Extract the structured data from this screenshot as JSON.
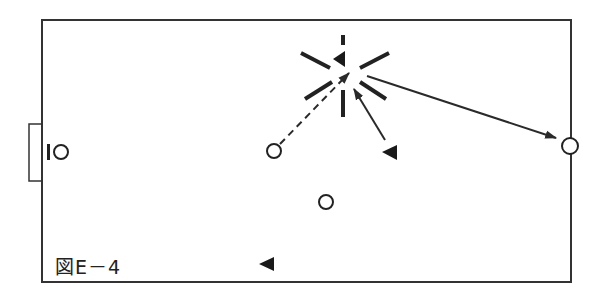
{
  "figure": {
    "caption": "図E－4",
    "colors": {
      "line": "#2a2a2a",
      "background": "#ffffff"
    }
  },
  "field": {
    "x": 42,
    "y": 20,
    "width": 529,
    "height": 262
  },
  "goal": {
    "x": 29,
    "y": 124,
    "width": 13,
    "height": 57
  },
  "goalkeeper": {
    "bar": {
      "x": 47,
      "y": 144,
      "width": 3,
      "height": 16
    },
    "circle": {
      "cx": 61,
      "cy": 152,
      "r": 7
    }
  },
  "players_circle": [
    {
      "id": "circle-mid-left",
      "cx": 274,
      "cy": 151,
      "r": 7
    },
    {
      "id": "circle-mid-low",
      "cx": 326,
      "cy": 202,
      "r": 7
    },
    {
      "id": "circle-right-edge",
      "cx": 570,
      "cy": 146,
      "r": 8
    }
  ],
  "players_triangle": [
    {
      "id": "triangle-burst-center",
      "points": "333,59 345,51 345,67"
    },
    {
      "id": "triangle-right",
      "points": "382,152 397,145 397,160"
    },
    {
      "id": "triangle-bottom",
      "points": "259,264 274,257 274,271"
    }
  ],
  "burst_lines": [
    {
      "x1": 343,
      "y1": 35,
      "x2": 343,
      "y2": 45
    },
    {
      "x1": 301,
      "y1": 53,
      "x2": 330,
      "y2": 68
    },
    {
      "x1": 360,
      "y1": 68,
      "x2": 389,
      "y2": 53
    },
    {
      "x1": 305,
      "y1": 99,
      "x2": 332,
      "y2": 82
    },
    {
      "x1": 360,
      "y1": 82,
      "x2": 386,
      "y2": 99
    },
    {
      "x1": 343,
      "y1": 90,
      "x2": 343,
      "y2": 117
    }
  ],
  "arrows": [
    {
      "id": "dashed-pass",
      "style": "dashed",
      "x1": 280,
      "y1": 144,
      "x2": 349,
      "y2": 73
    },
    {
      "id": "solid-run",
      "style": "solid",
      "x1": 385,
      "y1": 140,
      "x2": 354,
      "y2": 89
    },
    {
      "id": "long-pass",
      "style": "solid",
      "x1": 367,
      "y1": 76,
      "x2": 556,
      "y2": 138
    }
  ]
}
